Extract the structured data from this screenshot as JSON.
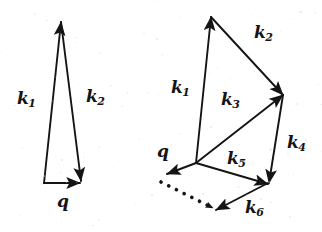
{
  "figure": {
    "background_color": "#ffffff",
    "ink_color": "#141414",
    "width": 322,
    "height": 232
  },
  "diagrams": [
    {
      "name": "single-scattering-triangle",
      "labels": [
        {
          "id": "left-k1",
          "base": "k",
          "sub": "1",
          "text": "k1",
          "x": 17,
          "y": 90
        },
        {
          "id": "left-k2",
          "base": "k",
          "sub": "2",
          "text": "k2",
          "x": 86,
          "y": 88
        },
        {
          "id": "left-q",
          "base": "q",
          "sub": "",
          "text": "q",
          "x": 57,
          "y": 193
        }
      ],
      "vectors": [
        {
          "id": "left-k1-arrow",
          "label": "k1",
          "x1": 44,
          "y1": 183,
          "x2": 61,
          "y2": 22,
          "style": "solid"
        },
        {
          "id": "left-k2-arrow",
          "label": "k2",
          "x1": 61,
          "y1": 22,
          "x2": 81,
          "y2": 181,
          "style": "solid"
        },
        {
          "id": "left-q-arrow",
          "label": "q",
          "x1": 44,
          "y1": 183,
          "x2": 80,
          "y2": 183,
          "style": "solid"
        }
      ]
    },
    {
      "name": "multiple-scattering-chain",
      "labels": [
        {
          "id": "right-k1",
          "base": "k",
          "sub": "1",
          "text": "k1",
          "x": 171,
          "y": 79
        },
        {
          "id": "right-k2",
          "base": "k",
          "sub": "2",
          "text": "k2",
          "x": 254,
          "y": 24
        },
        {
          "id": "right-k3",
          "base": "k",
          "sub": "3",
          "text": "k3",
          "x": 221,
          "y": 91
        },
        {
          "id": "right-k4",
          "base": "k",
          "sub": "4",
          "text": "k4",
          "x": 287,
          "y": 134
        },
        {
          "id": "right-k5",
          "base": "k",
          "sub": "5",
          "text": "k5",
          "x": 227,
          "y": 150
        },
        {
          "id": "right-k6",
          "base": "k",
          "sub": "6",
          "text": "k6",
          "x": 245,
          "y": 199
        },
        {
          "id": "right-q",
          "base": "q",
          "sub": "",
          "text": "q",
          "x": 157,
          "y": 143
        }
      ],
      "vectors": [
        {
          "id": "right-k1-arrow",
          "label": "k1",
          "x1": 196,
          "y1": 163,
          "x2": 211,
          "y2": 17,
          "style": "solid"
        },
        {
          "id": "right-k2-arrow",
          "label": "k2",
          "x1": 211,
          "y1": 17,
          "x2": 283,
          "y2": 95,
          "style": "solid"
        },
        {
          "id": "right-k3-arrow",
          "label": "k3",
          "x1": 196,
          "y1": 163,
          "x2": 283,
          "y2": 95,
          "style": "solid"
        },
        {
          "id": "right-k4-arrow",
          "label": "k4",
          "x1": 283,
          "y1": 95,
          "x2": 269,
          "y2": 183,
          "style": "solid"
        },
        {
          "id": "right-k5-arrow",
          "label": "k5",
          "x1": 196,
          "y1": 163,
          "x2": 268,
          "y2": 184,
          "style": "solid"
        },
        {
          "id": "right-k6-arrow",
          "label": "k6",
          "x1": 268,
          "y1": 183,
          "x2": 216,
          "y2": 210,
          "style": "solid"
        },
        {
          "id": "right-q-arrow",
          "label": "q",
          "x1": 196,
          "y1": 163,
          "x2": 167,
          "y2": 174,
          "style": "solid"
        },
        {
          "id": "right-dotted-arrow",
          "label": "",
          "x1": 161,
          "y1": 182,
          "x2": 213,
          "y2": 208,
          "style": "dotted"
        }
      ]
    }
  ]
}
